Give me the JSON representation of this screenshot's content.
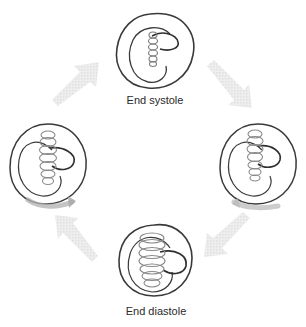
{
  "diagram": {
    "type": "cycle",
    "direction": "clockwise",
    "stages": [
      {
        "position": "top",
        "label": "End systole"
      },
      {
        "position": "right",
        "label": ""
      },
      {
        "position": "bottom",
        "label": "End diastole"
      },
      {
        "position": "left",
        "label": ""
      }
    ],
    "arrows": [
      {
        "from": "top",
        "to": "right"
      },
      {
        "from": "right",
        "to": "bottom"
      },
      {
        "from": "bottom",
        "to": "left"
      },
      {
        "from": "left",
        "to": "top"
      }
    ],
    "colors": {
      "loop_stroke": "#3a3a3a",
      "coil_stroke": "#8a8a8a",
      "arrow_fill": "#e6e6e6",
      "sweep_arrow": "#b8b8b8",
      "label_text": "#2a2a2a"
    }
  }
}
